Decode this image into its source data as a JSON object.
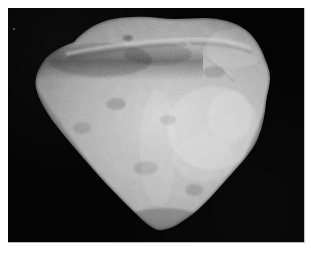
{
  "page": {
    "kind": "photograph",
    "subject_label": "rock specimen photograph",
    "background_color": "#ffffff",
    "caption": ""
  },
  "photo": {
    "field_color": "#040404",
    "field_label": "black photographic background",
    "width_px": 297,
    "height_px": 235,
    "margin_px": 8,
    "orientation": "landscape"
  },
  "specimen": {
    "name": "rock-specimen",
    "description": "coarse granular rock slab photographed in grayscale on a black field",
    "outline_shape": "shield / heart-like, broad rounded top tapering to a blunt point at bottom",
    "surface": "fine granular speckled matrix with scattered dark mineral grains and bright reflective patches",
    "features": [
      "horizontal fracture ridge crossing the upper third",
      "dark shadowed band below the upper ridge on the left",
      "bright highlight zone on the right-centre face",
      "straight faceted edge along the lower-left",
      "small notched step near the bottom point"
    ],
    "tone_range": {
      "darkest": "#1c1c1c",
      "midtone": "#8f8f8f",
      "lightest": "#ececec"
    },
    "bounds_px": {
      "top": 16,
      "bottom": 230,
      "left": 35,
      "right": 271
    }
  },
  "markings": {
    "corner_speck": {
      "label": "faint light speck",
      "x_px": 13,
      "y_px": 28
    }
  }
}
